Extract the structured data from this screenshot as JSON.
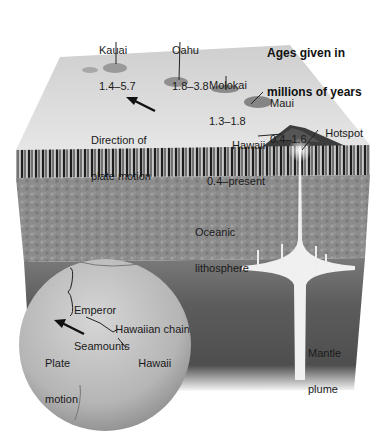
{
  "figure": {
    "legend_note": {
      "line1": "Ages given in",
      "line2": "millions of years"
    }
  },
  "islands": [
    {
      "name": "Kauai",
      "age": "1.4–5.7"
    },
    {
      "name": "Oahu",
      "age": "1.8–3.8"
    },
    {
      "name": "Molokai",
      "age": "1.3–1.8"
    },
    {
      "name": "Maui",
      "age": "0.4–1.6"
    },
    {
      "name": "Hawaii",
      "age": "0.4–present"
    }
  ],
  "block_labels": {
    "direction": {
      "line1": "Direction of",
      "line2": "plate motion"
    },
    "hotspot": "Hotspot",
    "lithosphere": {
      "line1": "Oceanic",
      "line2": "lithosphere"
    },
    "plume": {
      "line1": "Mantle",
      "line2": "plume"
    }
  },
  "globe_labels": {
    "emperor": {
      "line1": "Emperor",
      "line2": "Seamounts"
    },
    "chain": "Hawaiian chain",
    "plate": {
      "line1": "Plate",
      "line2": "motion"
    },
    "hawaii": "Hawaii"
  },
  "colors": {
    "surface": "#d9d9d9",
    "stripes_dark": "#2a2a2a",
    "stripes_light": "#9a9a9a",
    "lithosphere": "#8a8a8a",
    "mantle": "#5a5a5a",
    "plume": "#f2f2f2",
    "globe": "#b8b8b8"
  }
}
